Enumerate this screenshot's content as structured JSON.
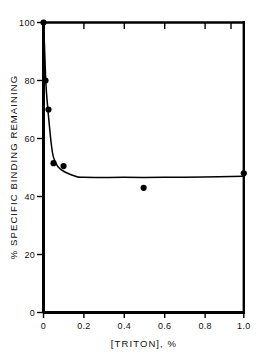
{
  "chart_data": {
    "type": "scatter",
    "title": "",
    "subtitle": "",
    "xlabel": "[TRITON], %",
    "ylabel": "% SPECIFIC BINDING REMAINING",
    "xlim": [
      0,
      1.0
    ],
    "ylim": [
      0,
      100
    ],
    "grid": false,
    "legend": "none",
    "x_ticks": [
      0,
      0.2,
      0.4,
      0.6,
      0.8,
      1.0
    ],
    "x_tick_labels": [
      "0",
      "0.2",
      "0.4",
      "0.6",
      "0.8",
      "1.0"
    ],
    "y_ticks": [
      0,
      20,
      40,
      60,
      80,
      100
    ],
    "y_tick_labels": [
      "0",
      "20",
      "40",
      "60",
      "80",
      "100"
    ],
    "top_axis_ticks": [
      0.2,
      0.4,
      0.6,
      0.8,
      1.0
    ],
    "marker": "filled-circle",
    "marker_color": "#000000",
    "line_color": "#000000",
    "points": [
      {
        "x": 0.0,
        "y": 100.0
      },
      {
        "x": 0.01,
        "y": 80.0
      },
      {
        "x": 0.025,
        "y": 70.0
      },
      {
        "x": 0.05,
        "y": 51.5
      },
      {
        "x": 0.1,
        "y": 50.5
      },
      {
        "x": 0.5,
        "y": 43.0
      },
      {
        "x": 1.0,
        "y": 48.0
      }
    ],
    "fitted_curve": [
      {
        "x": 0.0,
        "y": 100.0
      },
      {
        "x": 0.005,
        "y": 92.0
      },
      {
        "x": 0.012,
        "y": 79.0
      },
      {
        "x": 0.02,
        "y": 71.5
      },
      {
        "x": 0.03,
        "y": 64.0
      },
      {
        "x": 0.04,
        "y": 57.5
      },
      {
        "x": 0.05,
        "y": 53.5
      },
      {
        "x": 0.07,
        "y": 50.5
      },
      {
        "x": 0.09,
        "y": 49.2
      },
      {
        "x": 0.12,
        "y": 48.0
      },
      {
        "x": 0.16,
        "y": 47.0
      },
      {
        "x": 0.2,
        "y": 46.6
      },
      {
        "x": 0.4,
        "y": 46.6
      },
      {
        "x": 0.6,
        "y": 46.6
      },
      {
        "x": 0.8,
        "y": 46.7
      },
      {
        "x": 1.0,
        "y": 47.0
      }
    ]
  },
  "figure": {
    "background_color": "#ffffff",
    "foreground_color": "#000000"
  }
}
